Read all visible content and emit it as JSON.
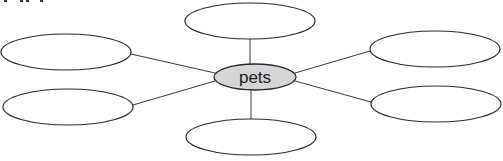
{
  "diagram": {
    "type": "web-organizer",
    "center": {
      "label": "pets",
      "cx": 255,
      "cy": 77,
      "rx": 41,
      "ry": 13,
      "fill": "#d6d6d6"
    },
    "nodes": [
      {
        "id": "top",
        "label": "",
        "cx": 250,
        "cy": 21,
        "rx": 65,
        "ry": 18
      },
      {
        "id": "left-top",
        "label": "",
        "cx": 66,
        "cy": 52,
        "rx": 65,
        "ry": 18
      },
      {
        "id": "left-bottom",
        "label": "",
        "cx": 68,
        "cy": 107,
        "rx": 65,
        "ry": 18
      },
      {
        "id": "right-top",
        "label": "",
        "cx": 435,
        "cy": 49,
        "rx": 65,
        "ry": 18
      },
      {
        "id": "right-bottom",
        "label": "",
        "cx": 436,
        "cy": 104,
        "rx": 65,
        "ry": 18
      },
      {
        "id": "bottom",
        "label": "",
        "cx": 251,
        "cy": 137,
        "rx": 65,
        "ry": 18
      }
    ],
    "edges": [
      {
        "to": "top",
        "x1": 250,
        "y1": 39,
        "x2": 250,
        "y2": 64
      },
      {
        "to": "left-top",
        "x1": 131,
        "y1": 54,
        "x2": 215,
        "y2": 73
      },
      {
        "to": "left-bottom",
        "x1": 133,
        "y1": 105,
        "x2": 215,
        "y2": 81
      },
      {
        "to": "right-top",
        "x1": 370,
        "y1": 51,
        "x2": 295,
        "y2": 73
      },
      {
        "to": "right-bottom",
        "x1": 371,
        "y1": 102,
        "x2": 295,
        "y2": 81
      },
      {
        "to": "bottom",
        "x1": 251,
        "y1": 90,
        "x2": 251,
        "y2": 119
      }
    ],
    "stroke_color": "#2a2a2a"
  }
}
